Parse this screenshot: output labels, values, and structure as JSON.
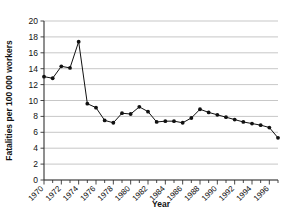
{
  "chart_data": {
    "type": "line",
    "title": "",
    "xlabel": "Year",
    "ylabel": "Fatalities per 100 000 workers",
    "xlim": [
      1970,
      1997
    ],
    "ylim": [
      0,
      20
    ],
    "ytick_step": 2,
    "grid": true,
    "legend": false,
    "marker": "filled-circle",
    "x": [
      1970,
      1971,
      1972,
      1973,
      1974,
      1975,
      1976,
      1977,
      1978,
      1979,
      1980,
      1981,
      1982,
      1983,
      1984,
      1985,
      1986,
      1987,
      1988,
      1989,
      1990,
      1991,
      1992,
      1993,
      1994,
      1995,
      1996,
      1997
    ],
    "values": [
      13.0,
      12.8,
      14.3,
      14.1,
      17.4,
      9.6,
      9.1,
      7.5,
      7.2,
      8.4,
      8.3,
      9.2,
      8.6,
      7.3,
      7.4,
      7.4,
      7.2,
      7.8,
      8.9,
      8.5,
      8.2,
      7.9,
      7.6,
      7.3,
      7.1,
      6.9,
      6.6,
      5.3
    ],
    "ytick_labels": [
      "0",
      "2",
      "4",
      "6",
      "8",
      "10",
      "12",
      "14",
      "16",
      "18",
      "20"
    ],
    "xtick_labels": [
      "1970",
      "1972",
      "1974",
      "1976",
      "1978",
      "1980",
      "1982",
      "1984",
      "1986",
      "1988",
      "1990",
      "1992",
      "1994",
      "1996"
    ],
    "xtick_label_years": [
      1970,
      1972,
      1974,
      1976,
      1978,
      1980,
      1982,
      1984,
      1986,
      1988,
      1990,
      1992,
      1994,
      1996
    ],
    "xtick_minor_years": [
      1971,
      1973,
      1975,
      1977,
      1979,
      1981,
      1983,
      1985,
      1987,
      1989,
      1991,
      1993,
      1995,
      1997
    ],
    "colors": {
      "line": "#111111",
      "marker": "#111111",
      "grid": "#b9b9b9",
      "axis": "#333333",
      "background": "#ffffff"
    }
  }
}
